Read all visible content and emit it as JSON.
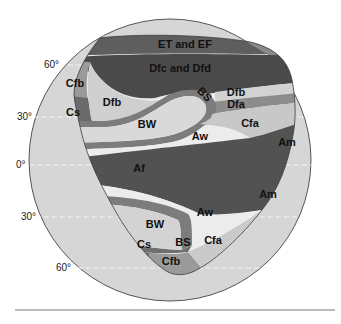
{
  "figure": {
    "latitude_labels": [
      {
        "id": "lat-60n",
        "text": "60°"
      },
      {
        "id": "lat-30n",
        "text": "30°"
      },
      {
        "id": "lat-0",
        "text": "0°"
      },
      {
        "id": "lat-30s",
        "text": "30°"
      },
      {
        "id": "lat-60s",
        "text": "60°"
      }
    ],
    "regions": [
      {
        "id": "et-ef",
        "label": "ET and EF"
      },
      {
        "id": "dfc-dfd",
        "label": "Dfc and Dfd"
      },
      {
        "id": "cfb-north",
        "label": "Cfb"
      },
      {
        "id": "cs-north",
        "label": "Cs"
      },
      {
        "id": "dfb-west",
        "label": "Dfb"
      },
      {
        "id": "bs-north",
        "label": "BS"
      },
      {
        "id": "dfb-east",
        "label": "Dfb"
      },
      {
        "id": "dfa",
        "label": "Dfa"
      },
      {
        "id": "bw-north",
        "label": "BW"
      },
      {
        "id": "cfa-north",
        "label": "Cfa"
      },
      {
        "id": "aw-north",
        "label": "Aw"
      },
      {
        "id": "am-north",
        "label": "Am"
      },
      {
        "id": "af",
        "label": "Af"
      },
      {
        "id": "am-south",
        "label": "Am"
      },
      {
        "id": "aw-south",
        "label": "Aw"
      },
      {
        "id": "bw-south",
        "label": "BW"
      },
      {
        "id": "bs-south",
        "label": "BS"
      },
      {
        "id": "cs-south",
        "label": "Cs"
      },
      {
        "id": "cfa-south",
        "label": "Cfa"
      },
      {
        "id": "cfb-south",
        "label": "Cfb"
      }
    ],
    "colors": {
      "background": "#ffffff",
      "globe": "#d6d6d6",
      "globe_outline": "#555555",
      "E": "#5e5e5e",
      "Dfc": "#4a4a4a",
      "Cfb": "#9a9a9a",
      "Cs": "#6a6a6a",
      "Dfb": "#cfcfcf",
      "BS": "#7c7c7c",
      "Dfa": "#8c8c8c",
      "BW": "#d9d9d9",
      "Cfa": "#c8c8c8",
      "Aw": "#ececec",
      "A_humid": "#525252",
      "rule": "#777777"
    }
  }
}
